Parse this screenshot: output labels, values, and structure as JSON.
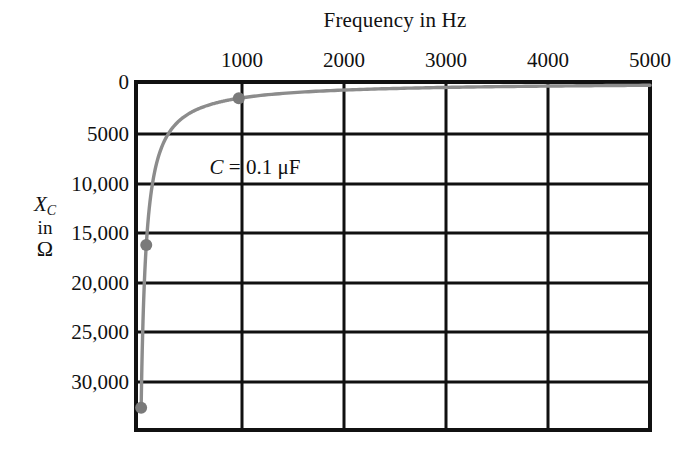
{
  "chart_data": {
    "type": "line",
    "title": "Frequency in Hz",
    "xlabel": "Frequency in Hz",
    "ylabel": "XC in Ω",
    "ylabel_lines": [
      "X",
      "C",
      "in",
      "Ω"
    ],
    "xlim": [
      0,
      5000
    ],
    "ylim": [
      0,
      34000
    ],
    "y_inverted": true,
    "grid": true,
    "legend": "none",
    "annotations": [
      {
        "text": "C = 0.1 μF",
        "symbol": "C",
        "equals": "=",
        "value": "0.1 μF",
        "x": 1000,
        "y": 7500
      }
    ],
    "xticks": [
      0,
      1000,
      2000,
      3000,
      4000,
      5000
    ],
    "xtick_labels": [
      "",
      "1000",
      "2000",
      "3000",
      "4000",
      "5000"
    ],
    "yticks": [
      0,
      5000,
      10000,
      15000,
      20000,
      25000,
      30000
    ],
    "ytick_labels": [
      "0",
      "5000",
      "10,000",
      "15,000",
      "20,000",
      "25,000",
      "30,000"
    ],
    "series": [
      {
        "name": "Xc = 1/(2πfC), C = 0.1 μF",
        "color": "#8c8c8c",
        "marker_color": "#7a7a7a",
        "x": [
          50,
          100,
          200,
          300,
          400,
          500,
          600,
          700,
          800,
          900,
          1000,
          1500,
          2000,
          2500,
          3000,
          3500,
          4000,
          4500,
          5000
        ],
        "y": [
          31831,
          15915,
          7958,
          5305,
          3979,
          3183,
          2653,
          2274,
          1989,
          1768,
          1592,
          1061,
          796,
          637,
          531,
          455,
          398,
          354,
          318
        ],
        "marked_points": [
          {
            "x": 50,
            "y": 31831
          },
          {
            "x": 100,
            "y": 15915
          },
          {
            "x": 1000,
            "y": 1592
          }
        ]
      }
    ]
  },
  "colors": {
    "axis": "#111111",
    "grid": "#111111",
    "curve": "#8c8c8c",
    "marker": "#7a7a7a",
    "background": "#ffffff"
  }
}
